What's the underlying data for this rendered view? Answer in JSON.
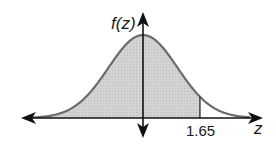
{
  "diagram": {
    "type": "standard normal distribution curve",
    "y_axis_label": "f(z)",
    "x_axis_label": "z",
    "marker_label": "1.65",
    "marker_z": 1.65,
    "shaded_region": "left of z = 1.65",
    "colors": {
      "curve": "#6b6b6b",
      "fill": "#d0d0d0",
      "axis": "#111111",
      "text": "#1a1a1a"
    }
  }
}
